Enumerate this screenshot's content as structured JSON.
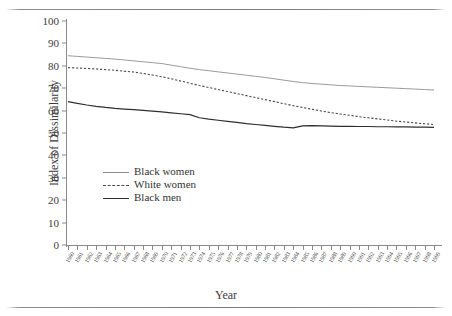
{
  "axes": {
    "ylabel": "Index of Dissimilarity",
    "xlabel": "Year",
    "yticks": [
      0,
      10,
      20,
      30,
      40,
      50,
      60,
      70,
      80,
      90,
      100
    ]
  },
  "legend": [
    {
      "label": "Black women",
      "style": "solid-thin",
      "color": "#8f8f8f"
    },
    {
      "label": "White women",
      "style": "dotted",
      "color": "#4a4a4a"
    },
    {
      "label": "Black men",
      "style": "solid-thick",
      "color": "#2e2e2e"
    }
  ],
  "chart_data": {
    "type": "line",
    "title": "",
    "xlabel": "Year",
    "ylabel": "Index of Dissimilarity",
    "ylim": [
      0,
      100
    ],
    "ytick_step": 10,
    "grid": false,
    "legend_position": "inside-lower-left",
    "x": [
      1960,
      1961,
      1962,
      1963,
      1964,
      1965,
      1966,
      1967,
      1968,
      1969,
      1970,
      1971,
      1972,
      1973,
      1974,
      1975,
      1976,
      1977,
      1978,
      1979,
      1980,
      1981,
      1982,
      1983,
      1984,
      1985,
      1986,
      1987,
      1988,
      1989,
      1990,
      1991,
      1992,
      1993,
      1994,
      1995,
      1996,
      1997,
      1998,
      1999
    ],
    "series": [
      {
        "name": "Black women",
        "color": "#8f8f8f",
        "style": "solid",
        "values": [
          84.5,
          84.2,
          83.9,
          83.6,
          83.3,
          83.0,
          82.6,
          82.2,
          81.8,
          81.4,
          81.0,
          80.3,
          79.6,
          78.9,
          78.3,
          77.8,
          77.3,
          76.8,
          76.3,
          75.8,
          75.3,
          74.8,
          74.2,
          73.6,
          73.0,
          72.5,
          72.1,
          71.8,
          71.5,
          71.2,
          71.0,
          70.8,
          70.6,
          70.4,
          70.2,
          70.0,
          69.8,
          69.6,
          69.4,
          69.2
        ]
      },
      {
        "name": "White women",
        "color": "#4a4a4a",
        "style": "dotted",
        "values": [
          79.2,
          79.0,
          78.8,
          78.6,
          78.3,
          78.0,
          77.6,
          77.2,
          76.6,
          75.9,
          75.1,
          74.2,
          73.2,
          72.2,
          71.2,
          70.3,
          69.4,
          68.5,
          67.6,
          66.7,
          65.8,
          64.9,
          64.0,
          63.1,
          62.2,
          61.4,
          60.6,
          59.8,
          59.1,
          58.5,
          57.9,
          57.3,
          56.8,
          56.3,
          55.8,
          55.3,
          54.9,
          54.5,
          54.1,
          53.8
        ]
      },
      {
        "name": "Black men",
        "color": "#2e2e2e",
        "style": "solid",
        "values": [
          64.0,
          63.2,
          62.5,
          61.9,
          61.4,
          61.0,
          60.7,
          60.4,
          60.1,
          59.8,
          59.4,
          59.0,
          58.6,
          58.2,
          56.8,
          56.2,
          55.7,
          55.2,
          54.7,
          54.2,
          53.8,
          53.4,
          53.0,
          52.6,
          52.3,
          53.2,
          53.3,
          53.2,
          53.1,
          53.0,
          53.0,
          52.9,
          52.9,
          52.8,
          52.8,
          52.7,
          52.7,
          52.6,
          52.6,
          52.5
        ]
      }
    ]
  }
}
